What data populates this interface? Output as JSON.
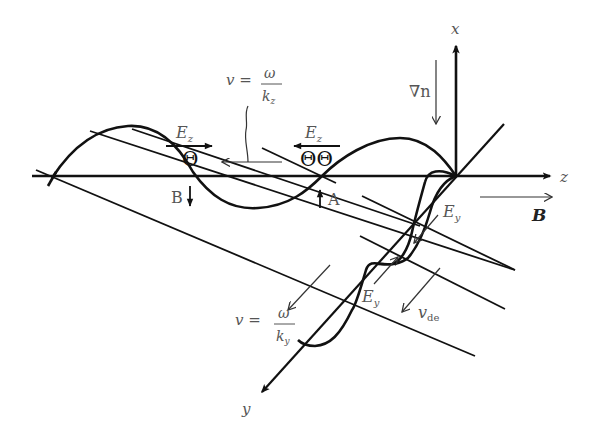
{
  "diagram": {
    "axes": {
      "x": "x",
      "y": "y",
      "z": "z"
    },
    "labels": {
      "grad_n": "∇n",
      "B_field": "B",
      "v_z_lhs": "v =",
      "v_z_num": "ω",
      "v_z_den": "k",
      "v_z_den_sub": "z",
      "v_y_lhs": "v =",
      "v_y_num": "ω",
      "v_y_den": "k",
      "v_y_den_sub": "y",
      "Ez_left": "E",
      "Ez_left_sub": "z",
      "Ez_right": "E",
      "Ez_right_sub": "z",
      "Ey_upper": "E",
      "Ey_upper_sub": "y",
      "Ey_lower": "E",
      "Ey_lower_sub": "y",
      "v_de": "v",
      "v_de_sub": "de",
      "point_A": "A",
      "point_B": "B",
      "charge_left": "Θ",
      "charge_right": "ΘΘ"
    },
    "colors": {
      "line": "#111111",
      "text": "#555555",
      "background": "#ffffff"
    }
  }
}
